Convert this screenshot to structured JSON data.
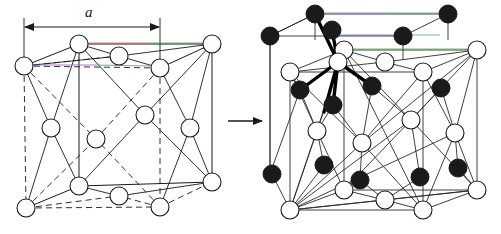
{
  "figure": {
    "type": "crystal-structure-diagram",
    "background_color": "#ffffff",
    "panels": [
      {
        "id": "left-panel",
        "name": "fcc-unit-cell",
        "description": "Face-centred cubic unit cell with lattice parameter a",
        "atom_style": "open-circle",
        "dimension_label": "a"
      },
      {
        "id": "right-panel",
        "name": "diamond-unit-cell",
        "description": "Diamond cubic cell: FCC lattice plus second interpenetrating FCC sublattice, tetrahedral bonds highlighted",
        "atom_styles": [
          "open-circle",
          "filled-circle"
        ]
      }
    ],
    "transition_arrow": {
      "name": "transformation-arrow",
      "direction": "right",
      "label": ""
    },
    "labels": {
      "lattice_parameter": "a"
    },
    "colors": {
      "stroke": "#1a1a1a",
      "atom_open_fill": "#ffffff",
      "atom_filled_fill": "#1a1a1a",
      "bond_highlight": "#000000",
      "artifact_red": "#e8544a",
      "artifact_green": "#3fa14a",
      "artifact_purple": "#8a5bbf",
      "artifact_blue": "#3b5fc0"
    },
    "geometry": {
      "left_cell": {
        "front_top_left": [
          79,
          44
        ],
        "front_top_right": [
          212,
          44
        ],
        "back_top_left": [
          24,
          66
        ],
        "back_top_right": [
          160,
          68
        ],
        "front_bottom_left": [
          79,
          186
        ],
        "front_bottom_right": [
          212,
          182
        ],
        "back_bottom_left": [
          26,
          208
        ],
        "back_bottom_right": [
          160,
          207
        ],
        "face_centers": [
          [
            51,
            128
          ],
          [
            96,
            139
          ],
          [
            145,
            115
          ],
          [
            190,
            128
          ],
          [
            119,
            56
          ],
          [
            119,
            196
          ]
        ]
      },
      "right_cell": {
        "origin_offset": [
          265,
          0
        ],
        "tetrahedral_center": [
          338,
          62
        ],
        "tetrahedral_neighbors": [
          [
            315,
            14
          ],
          [
            332,
            30
          ],
          [
            300,
            90
          ],
          [
            372,
            86
          ]
        ]
      }
    }
  }
}
